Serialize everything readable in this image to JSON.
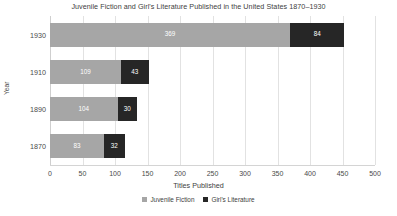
{
  "chart_data": {
    "type": "bar",
    "orientation": "horizontal",
    "stacked": true,
    "title": "Juvenile Fiction and Girl's Literature Published in the United States 1870–1930",
    "xlabel": "Titles Published",
    "ylabel": "Year",
    "categories": [
      "1930",
      "1910",
      "1890",
      "1870"
    ],
    "series": [
      {
        "name": "Juvenile Fiction",
        "color": "#a6a6a6",
        "values": [
          369,
          109,
          104,
          83
        ]
      },
      {
        "name": "Girl's Literature",
        "color": "#262626",
        "values": [
          84,
          43,
          30,
          32
        ]
      }
    ],
    "xlim": [
      0,
      500
    ],
    "xticks": [
      0,
      50,
      100,
      150,
      200,
      250,
      300,
      350,
      400,
      450,
      500
    ],
    "xtick_labels": [
      "0",
      "50",
      "100",
      "150",
      "200",
      "250",
      "300",
      "350",
      "400",
      "450",
      "500"
    ],
    "grid": "vertical",
    "legend_position": "bottom-center",
    "data_labels": [
      [
        "369",
        "84"
      ],
      [
        "109",
        "43"
      ],
      [
        "104",
        "30"
      ],
      [
        "83",
        "32"
      ]
    ]
  },
  "colors": {
    "juvenile_fiction": "#a6a6a6",
    "girls_literature": "#262626",
    "gridline": "#e2e2e2",
    "axis": "#d4d4d4",
    "text": "#404040",
    "background": "#ffffff"
  }
}
